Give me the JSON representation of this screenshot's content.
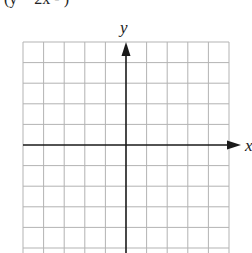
{
  "header": {
    "cropped_text": "(y = 2x - )"
  },
  "graph": {
    "x_label": "x",
    "y_label": "y",
    "grid_columns": 10,
    "grid_rows_visible": 10,
    "grid_color": "#b3b3b3",
    "axis_color": "#1a1a1a"
  }
}
